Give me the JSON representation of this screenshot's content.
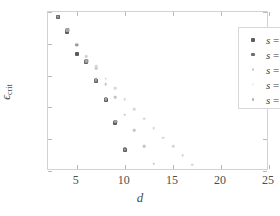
{
  "chart_data": {
    "type": "scatter",
    "title": "",
    "xlabel": "d",
    "ylabel": "ϵ_crit",
    "ylabel_base": "ϵ",
    "ylabel_sub": "crit",
    "xlim": [
      2,
      25
    ],
    "ylim": [
      0,
      1
    ],
    "xticks": [
      5,
      10,
      15,
      20,
      25
    ],
    "yticks": [
      0,
      0.2,
      0.4,
      0.6,
      0.8,
      1
    ],
    "xticklabels": [
      "5",
      "10",
      "15",
      "20",
      "25"
    ],
    "yticklabels": [
      "0",
      "0.2",
      "0.4",
      "0.6",
      "0.8",
      "1"
    ],
    "grid": false,
    "legend_position": "top-right",
    "series": [
      {
        "name": "s = 5",
        "label": "s = 5",
        "color": "#5c5c5c",
        "marker": "square",
        "marker_size": 4.0,
        "x": [
          3,
          4,
          5,
          6,
          7,
          8,
          9,
          10
        ],
        "y": [
          0.97,
          0.875,
          0.735,
          0.685,
          0.565,
          0.445,
          0.305,
          0.135
        ]
      },
      {
        "name": "s = 10",
        "label": "s = 10",
        "color": "#6e6e6e",
        "marker": "square",
        "marker_size": 3.4,
        "x": [
          3,
          4,
          5,
          6,
          7,
          8,
          9,
          10
        ],
        "y": [
          0.97,
          0.885,
          0.795,
          0.69,
          0.57,
          0.45,
          0.31,
          0.14
        ]
      },
      {
        "name": "s = 15",
        "label": "s = 15",
        "color": "#c4c4c4",
        "marker": "square",
        "marker_size": 2.6,
        "x": [
          4,
          5,
          6,
          7,
          8,
          9,
          10,
          11,
          12,
          13
        ],
        "y": [
          0.885,
          0.8,
          0.72,
          0.645,
          0.545,
          0.465,
          0.355,
          0.255,
          0.155,
          0.045
        ]
      },
      {
        "name": "s = 20",
        "label": "s = 20",
        "color": "#d8d8d8",
        "marker": "square",
        "marker_size": 2.6,
        "x": [
          5,
          6,
          7,
          8,
          9,
          10,
          11,
          12,
          13,
          14,
          15,
          16,
          17
        ],
        "y": [
          0.8,
          0.725,
          0.66,
          0.58,
          0.52,
          0.45,
          0.39,
          0.33,
          0.27,
          0.21,
          0.155,
          0.1,
          0.04
        ]
      },
      {
        "name": "s = 25",
        "label": "s = 25",
        "color": "#a8a8a8",
        "marker": "square",
        "marker_size": 2.4,
        "x": [
          2,
          3,
          4,
          5,
          6,
          7,
          8,
          9,
          10,
          11,
          12,
          13,
          14,
          15,
          16,
          17,
          18,
          19,
          20,
          21,
          22,
          23,
          24,
          25
        ],
        "y": [
          1.0,
          0.97,
          0.885,
          0.795,
          0.69,
          0.57,
          0.45,
          0.31,
          0.135,
          0.0,
          0.0,
          0.0,
          0.0,
          0.0,
          0.0,
          0.0,
          0.0,
          0.0,
          0.0,
          0.0,
          0.0,
          0.0,
          0.0,
          0.0
        ]
      },
      {
        "name": "baseline-zero",
        "label": "",
        "color": "#9d9d9d",
        "marker": "square",
        "marker_size": 2.4,
        "x": [
          18,
          19,
          20,
          21,
          22,
          23,
          24,
          25
        ],
        "y": [
          0,
          0,
          0,
          0,
          0,
          0,
          0,
          0
        ]
      }
    ]
  },
  "legend": {
    "entries": [
      {
        "label": "s = 5",
        "color": "#5c5c5c",
        "size": 4.0
      },
      {
        "label": "s = 10",
        "color": "#6e6e6e",
        "size": 3.6
      },
      {
        "label": "s = 15",
        "color": "#cfcfcf",
        "size": 2.6
      },
      {
        "label": "s = 20",
        "color": "#f0f0f0",
        "size": 2.2
      },
      {
        "label": "s = 25",
        "color": "#b0b0b0",
        "size": 2.6
      }
    ]
  }
}
